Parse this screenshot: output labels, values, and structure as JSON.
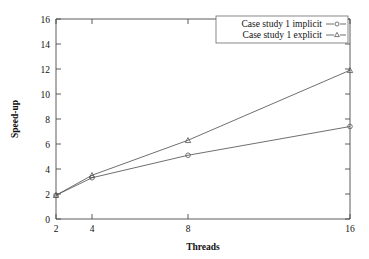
{
  "chart_data": {
    "type": "line",
    "title": "",
    "xlabel": "Threads",
    "ylabel": "Speed-up",
    "x": [
      2,
      4,
      8,
      16
    ],
    "xtick_labels": [
      "2",
      "4",
      "8",
      "16"
    ],
    "ytick_labels": [
      "0",
      "2",
      "4",
      "6",
      "8",
      "10",
      "12",
      "14",
      "16"
    ],
    "yticks": [
      0,
      2,
      4,
      6,
      8,
      10,
      12,
      14,
      16
    ],
    "ylim": [
      0,
      16
    ],
    "xlim": [
      2,
      16
    ],
    "grid": false,
    "legend_position": "top-right",
    "series": [
      {
        "name": "Case study 1 implicit",
        "marker": "open-circle",
        "values": [
          1.9,
          3.3,
          5.1,
          7.4
        ]
      },
      {
        "name": "Case study 1 explicit",
        "marker": "open-triangle",
        "values": [
          1.9,
          3.5,
          6.3,
          11.9
        ]
      }
    ]
  },
  "colors": {
    "axis": "#4a4a4a",
    "series_implicit": "#555555",
    "series_explicit": "#555555",
    "background": "#ffffff"
  }
}
